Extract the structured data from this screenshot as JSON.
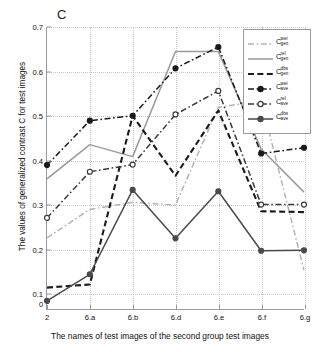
{
  "panel": {
    "letter": "C"
  },
  "axes": {
    "ylabel": "The values of generalized contrast C for test images",
    "xlabel": "The names of test images of the second group test images",
    "origin_label": "0",
    "yticks": [
      "0.1",
      "0.2",
      "0.3",
      "0.4",
      "0.5",
      "0.6",
      "0.7"
    ],
    "xticks": [
      "2",
      "6.a",
      "6.b",
      "6.d",
      "6.e",
      "6.f",
      "6.g"
    ]
  },
  "chart_data": {
    "type": "line",
    "title": "C",
    "xlabel": "The names of test images of the second group test images",
    "ylabel": "The values of generalized contrast C for test images",
    "categories": [
      "2",
      "6.a",
      "6.b",
      "6.d",
      "6.e",
      "6.f",
      "6.g"
    ],
    "ylim": [
      0.065,
      0.7
    ],
    "xlim": [
      0,
      6
    ],
    "yticks": [
      0.1,
      0.2,
      0.3,
      0.4,
      0.5,
      0.6,
      0.7
    ],
    "grid": true,
    "legend_position": "top-right",
    "series": [
      {
        "name": "C_gen^wei",
        "label_base": "C",
        "label_sup": "wei",
        "label_sub": "gen",
        "color": "#b4b4b4",
        "style": "dashdot",
        "marker": "none",
        "values": [
          0.225,
          0.289,
          0.305,
          0.299,
          0.519,
          0.534,
          0.152
        ]
      },
      {
        "name": "C_gen^rel",
        "label_base": "C",
        "label_sup": "rel",
        "label_sub": "gen",
        "color": "#9a9a9a",
        "style": "solid",
        "marker": "none",
        "values": [
          0.358,
          0.435,
          0.408,
          0.645,
          0.645,
          0.425,
          0.328
        ]
      },
      {
        "name": "C_gen^dbs",
        "label_base": "C",
        "label_sup": "dbs",
        "label_sub": "gen",
        "color": "#1a1a1a",
        "style": "dashed",
        "marker": "none",
        "values": [
          0.113,
          0.12,
          0.5,
          0.365,
          0.512,
          0.285,
          0.283
        ]
      },
      {
        "name": "C_ave^wei",
        "label_base": "C",
        "label_sup": "wei",
        "label_sub": "ave",
        "color": "#1a1a1a",
        "style": "dashdot",
        "marker": "dot",
        "values": [
          0.389,
          0.489,
          0.5,
          0.607,
          0.655,
          0.415,
          0.428
        ]
      },
      {
        "name": "C_ave^rel",
        "label_base": "C",
        "label_sup": "rel",
        "label_sub": "ave",
        "color": "#3a3a3a",
        "style": "dashdot",
        "marker": "circle",
        "values": [
          0.27,
          0.374,
          0.39,
          0.503,
          0.556,
          0.3,
          0.3
        ]
      },
      {
        "name": "C_ave^dbs",
        "label_base": "C",
        "label_sup": "dbs",
        "label_sub": "ave",
        "color": "#4a4a4a",
        "style": "solid",
        "marker": "dot",
        "values": [
          0.083,
          0.143,
          0.333,
          0.224,
          0.33,
          0.196,
          0.197
        ]
      }
    ]
  }
}
